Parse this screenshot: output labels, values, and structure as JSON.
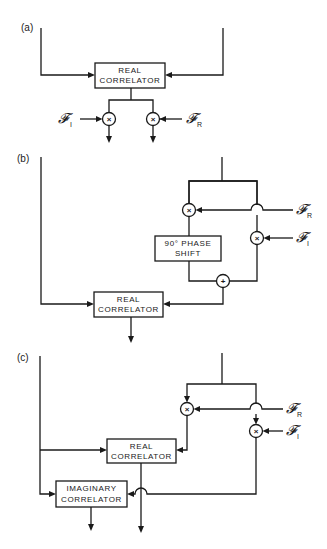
{
  "panels": {
    "a": {
      "label": "(a)",
      "real_correlator": [
        "REAL",
        "CORRELATOR"
      ],
      "multiplier_left": "×",
      "multiplier_right": "×",
      "input_left": {
        "symbol": "𝓕",
        "subscript": "I"
      },
      "input_right": {
        "symbol": "𝓕",
        "subscript": "R"
      }
    },
    "b": {
      "label": "(b)",
      "phase_shift": [
        "90° PHASE",
        "SHIFT"
      ],
      "real_correlator": [
        "REAL",
        "CORRELATOR"
      ],
      "multiplier_top": "×",
      "multiplier_right": "×",
      "adder": "+",
      "input_r": {
        "symbol": "𝓕",
        "subscript": "R"
      },
      "input_i": {
        "symbol": "𝓕",
        "subscript": "I"
      }
    },
    "c": {
      "label": "(c)",
      "real_correlator": [
        "REAL",
        "CORRELATOR"
      ],
      "imaginary_correlator": [
        "IMAGINARY",
        "CORRELATOR"
      ],
      "multiplier_left": "×",
      "multiplier_right": "×",
      "input_r": {
        "symbol": "𝓕",
        "subscript": "R"
      },
      "input_i": {
        "symbol": "𝓕",
        "subscript": "I"
      }
    }
  }
}
